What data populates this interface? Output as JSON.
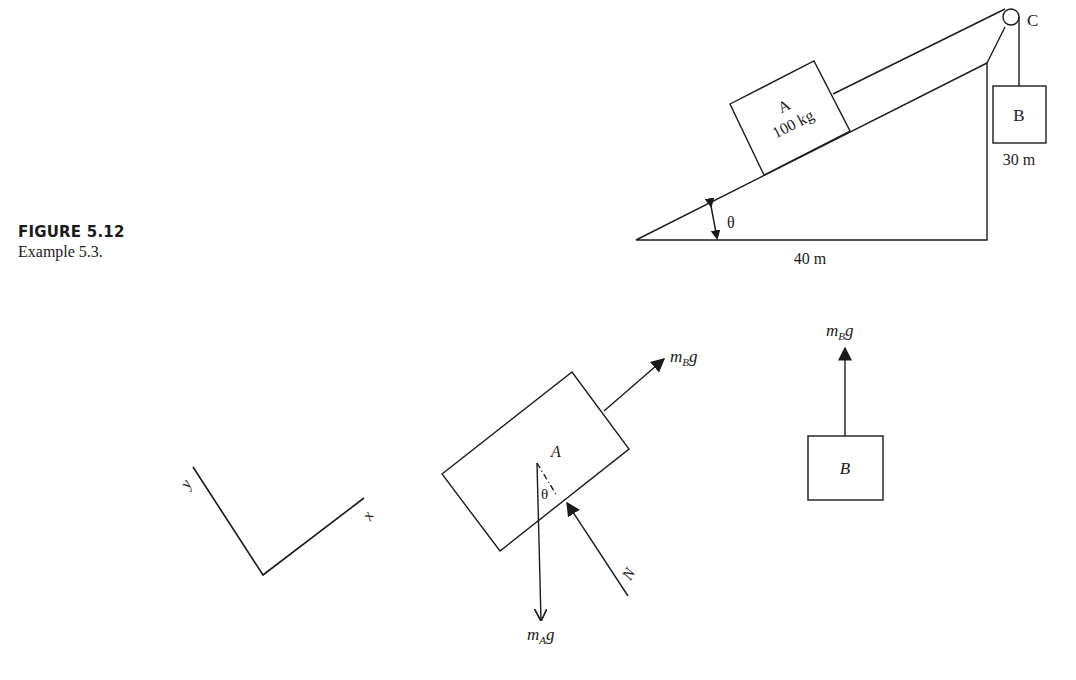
{
  "caption": {
    "figure_number": "FIGURE 5.12",
    "text": "Example 5.3."
  },
  "incline_diagram": {
    "block_a": {
      "name": "A",
      "mass": "100 kg"
    },
    "block_b": {
      "name": "B"
    },
    "pulley": {
      "name": "C"
    },
    "angle_label": "θ",
    "base_length": "40 m",
    "height_length": "30 m"
  },
  "axes": {
    "x_label": "x",
    "y_label": "y"
  },
  "fbd_a": {
    "block_label": "A",
    "angle_label": "θ",
    "tension_label_m": "m",
    "tension_label_sub": "B",
    "tension_label_g": "g",
    "weight_label_m": "m",
    "weight_label_sub": "A",
    "weight_label_g": "g",
    "normal_label": "N"
  },
  "fbd_b": {
    "block_label": "B",
    "force_label_m": "m",
    "force_label_sub": "B",
    "force_label_g": "g"
  },
  "colors": {
    "ink": "#1a1a1a",
    "background": "#ffffff"
  }
}
